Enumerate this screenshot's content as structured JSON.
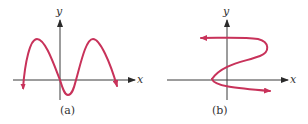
{
  "figures": [
    {
      "caption": "(a)",
      "x_axis_label": "x",
      "y_axis_label": "y",
      "description": "Sinusoid-like function graph crossing origin, two peaks above x-axis, one trough below, arrows at both ends pointing down"
    },
    {
      "caption": "(b)",
      "x_axis_label": "x",
      "y_axis_label": "y",
      "description": "S-shaped curve that is not a function (fails vertical line test), arrow pointing left at top and arrow pointing right at bottom"
    }
  ],
  "colors": {
    "curve": "#c8325a",
    "axis": "#3a3a3a",
    "background": "#ffffff"
  }
}
